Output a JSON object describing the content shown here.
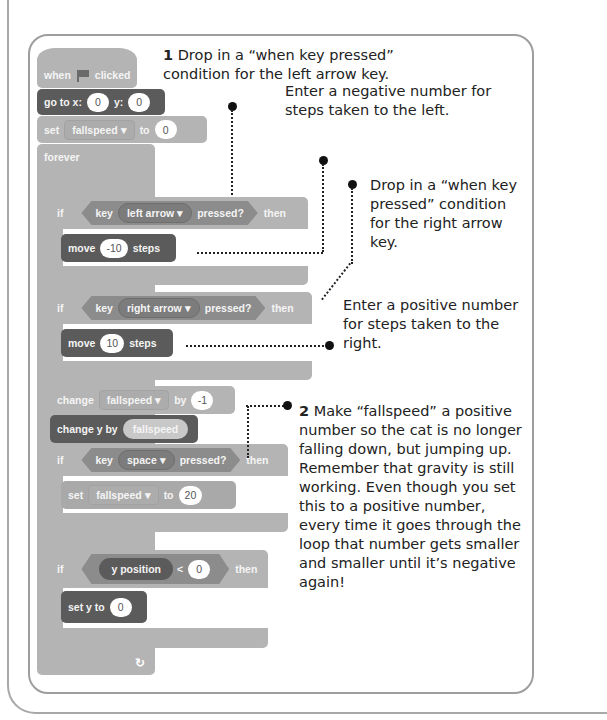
{
  "blocks": {
    "hat": {
      "when": "when",
      "clicked": "clicked",
      "icon": "green-flag-icon"
    },
    "goto": {
      "label": "go to x:",
      "x": "0",
      "y_label": "y:",
      "y": "0"
    },
    "set1": {
      "label": "set",
      "var": "fallspeed ▾",
      "to": "to",
      "value": "0"
    },
    "forever": {
      "label": "forever"
    },
    "if1": {
      "if": "if",
      "key": "key",
      "key_value": "left arrow ▾",
      "pressed": "pressed?",
      "then": "then"
    },
    "move1": {
      "label": "move",
      "value": "-10",
      "steps": "steps"
    },
    "if2": {
      "if": "if",
      "key": "key",
      "key_value": "right arrow ▾",
      "pressed": "pressed?",
      "then": "then"
    },
    "move2": {
      "label": "move",
      "value": "10",
      "steps": "steps"
    },
    "change1": {
      "label": "change",
      "var": "fallspeed ▾",
      "by": "by",
      "value": "-1"
    },
    "changey": {
      "label": "change y by",
      "reporter": "fallspeed"
    },
    "if3": {
      "if": "if",
      "key": "key",
      "key_value": "space ▾",
      "pressed": "pressed?",
      "then": "then"
    },
    "set2": {
      "label": "set",
      "var": "fallspeed ▾",
      "to": "to",
      "value": "20"
    },
    "if4": {
      "if": "if",
      "reporter": "y position",
      "op": "<",
      "value": "0",
      "then": "then"
    },
    "sety": {
      "label": "set y to",
      "value": "0"
    },
    "loop_arrow": "↻"
  },
  "annotations": {
    "a1": {
      "num": "1",
      "text": "Drop in a “when key pressed” condition for the left arrow key."
    },
    "a2": {
      "text": "Enter a negative number for steps taken to the left."
    },
    "a3": {
      "text": "Drop in a “when key pressed” condition for the right arrow key."
    },
    "a4": {
      "text": "Enter a positive number for steps taken to the right."
    },
    "a5": {
      "num": "2",
      "text": "Make “fallspeed” a positive number so the cat is no longer falling down, but jumping up. Remember that gravity is still working. Even though you set this to a positive number, every time it goes through the loop that number gets smaller and smaller until it’s negative again!"
    }
  },
  "colors": {
    "light_block": "#b4b4b4",
    "dark_block": "#5b5b5b",
    "mid_block": "#8c8c8c",
    "frame": "#9e9e9e",
    "text": "#222222"
  }
}
